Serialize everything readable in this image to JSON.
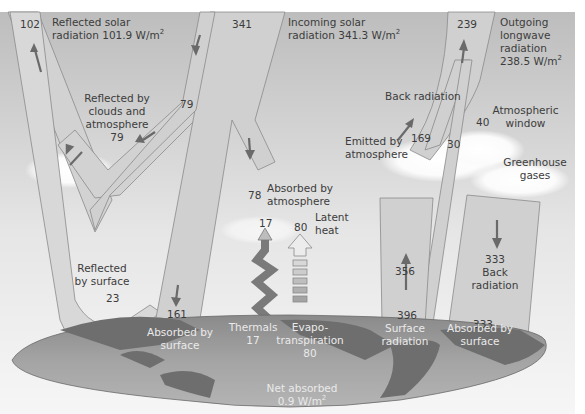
{
  "diagram": {
    "colors": {
      "sky_top": "#bdbdbd",
      "sky_bottom": "#f4f4f4",
      "band_fill": "#d2d2d2",
      "band_stroke": "#8a8a8a",
      "arrow": "#6a6a6a",
      "globe_ocean": "#9e9e9e",
      "globe_land": "#6e6e6e",
      "text": "#3c3c3c",
      "globe_text": "#eaeaea"
    },
    "flows": {
      "reflected_solar": {
        "label_line1": "Reflected solar",
        "label_line2": "radiation 101.9 W/m",
        "sup": "2",
        "value": "102"
      },
      "incoming_solar": {
        "label_line1": "Incoming solar",
        "label_line2": "radiation 341.3 W/m",
        "sup": "2",
        "value": "341"
      },
      "outgoing_longwave": {
        "label_line1": "Outgoing",
        "label_line2": "longwave",
        "label_line3": "radiation",
        "label_line4": "238.5 W/m",
        "sup": "2",
        "value": "239"
      },
      "reflected_by_clouds": {
        "label_line1": "Reflected by",
        "label_line2": "clouds and",
        "label_line3": "atmosphere",
        "value": "79",
        "value_branch": "79"
      },
      "absorbed_by_atmosphere": {
        "label_line1": "Absorbed by",
        "label_line2": "atmosphere",
        "value": "78"
      },
      "reflected_by_surface": {
        "label_line1": "Reflected",
        "label_line2": "by surface",
        "value": "23"
      },
      "absorbed_by_surface_solar": {
        "label_line1": "Absorbed by",
        "label_line2": "surface",
        "value": "161"
      },
      "thermals": {
        "value_top": "17",
        "label": "Thermals",
        "value": "17"
      },
      "evapotranspiration": {
        "value_top": "80",
        "latent_line1": "Latent",
        "latent_line2": "heat",
        "label_line1": "Evapo-",
        "label_line2": "transpiration",
        "value": "80"
      },
      "back_radiation_top": {
        "label": "Back radiation"
      },
      "emitted_by_atmosphere": {
        "label_line1": "Emitted by",
        "label_line2": "atmosphere",
        "value": "169"
      },
      "cloud_emission": {
        "value": "30"
      },
      "atmospheric_window": {
        "label_line1": "Atmospheric",
        "label_line2": "window",
        "value": "40"
      },
      "greenhouse_gases": {
        "label_line1": "Greenhouse",
        "label_line2": "gases"
      },
      "surface_radiation": {
        "value_mid": "356",
        "value_bottom": "396",
        "label_line1": "Surface",
        "label_line2": "radiation"
      },
      "back_radiation_surface": {
        "value": "333",
        "label_line1": "Back",
        "label_line2": "radiation",
        "value_bottom": "333",
        "absorbed_line1": "Absorbed by",
        "absorbed_line2": "surface"
      },
      "net_absorbed": {
        "label_line1": "Net absorbed",
        "label_line2": "0.9 W/m",
        "sup": "2"
      }
    }
  }
}
